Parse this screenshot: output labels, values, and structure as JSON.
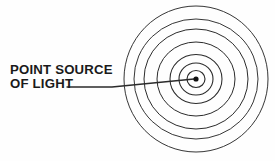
{
  "figure": {
    "background_color": "#fefefe",
    "stroke_color": "#2b2b2b",
    "label": {
      "line1": "POINT SOURCE",
      "line2": "OF LIGHT",
      "x": 10,
      "y_line1": 74,
      "y_line2": 88,
      "font_size": 13.2,
      "color": "#1a1a1a"
    },
    "leader_line": {
      "start_x": 67,
      "start_y": 87,
      "mid_x": 112,
      "mid_y": 87,
      "end_x": 194,
      "end_y": 79,
      "stroke_width": 1.3
    },
    "point_source": {
      "cx": 196,
      "cy": 79,
      "radius": 2.6,
      "fill": "#111111"
    },
    "wavefronts": {
      "cx": 196,
      "cy": 79,
      "count": 7,
      "rings": [
        {
          "index": 1,
          "rx": 9,
          "ry": 8.5,
          "stroke_width": 1.15
        },
        {
          "index": 2,
          "rx": 17,
          "ry": 16,
          "stroke_width": 1.1
        },
        {
          "index": 3,
          "rx": 26,
          "ry": 24.5,
          "stroke_width": 1.05
        },
        {
          "index": 4,
          "rx": 39,
          "ry": 37,
          "stroke_width": 1.0
        },
        {
          "index": 5,
          "rx": 52,
          "ry": 50,
          "stroke_width": 1.0
        },
        {
          "index": 6,
          "rx": 62,
          "ry": 60,
          "stroke_width": 0.95
        },
        {
          "index": 7,
          "rx": 72,
          "ry": 73,
          "stroke_width": 0.95
        }
      ]
    }
  }
}
